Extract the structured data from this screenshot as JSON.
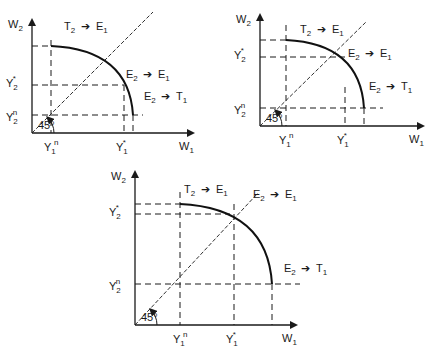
{
  "panels": [
    {
      "name": "panel-top-left",
      "labels": {
        "y_axis": "W2",
        "x_axis": "W1",
        "y2_star": "Y2*",
        "y2_n": "Y2n",
        "y1_n": "Y1n",
        "y1_star": "Y1*",
        "angle": "45°",
        "region_t2_e1": "T2 → E1",
        "region_e2_e1": "E2 → E1",
        "region_e2_t1": "E2 → T1"
      }
    },
    {
      "name": "panel-top-right",
      "labels": {
        "y_axis": "W2",
        "x_axis": "W1",
        "y2_star": "Y2*",
        "y2_n": "Y2n",
        "y1_n": "Y1n",
        "y1_star": "Y1*",
        "angle": "45°",
        "region_t2_e1": "T2 → E1",
        "region_e2_e1": "E2 → E1",
        "region_e2_t1": "E2 → T1"
      }
    },
    {
      "name": "panel-bottom",
      "labels": {
        "y_axis": "W2",
        "x_axis": "W1",
        "y2_star": "Y2*",
        "y2_n": "Y2n",
        "y1_n": "Y1n",
        "y1_star": "Y1*",
        "angle": "45°",
        "region_t2_e1": "T2 → E1",
        "region_e2_e1": "E2 → E1",
        "region_e2_t1": "E2 → T1"
      }
    }
  ]
}
